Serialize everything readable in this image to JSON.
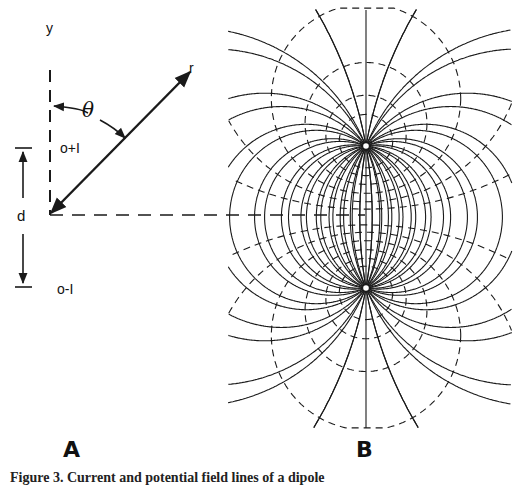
{
  "panel_a": {
    "label": "A",
    "axis_y_label": "y",
    "radius_label": "r",
    "angle_label": "θ",
    "distance_label": "d",
    "positive_source_label": "o+I",
    "negative_source_label": "o-I"
  },
  "panel_b": {
    "label": "B",
    "positive_electrode": {
      "x": 366,
      "y": 146
    },
    "negative_electrode": {
      "x": 366,
      "y": 288
    },
    "current_line_style": "solid",
    "equipotential_style": "dashed"
  },
  "caption": {
    "text": "Figure 3. Current and potential field lines of a dipole"
  },
  "colors": {
    "ink": "#1a1a1a",
    "background": "#ffffff"
  }
}
